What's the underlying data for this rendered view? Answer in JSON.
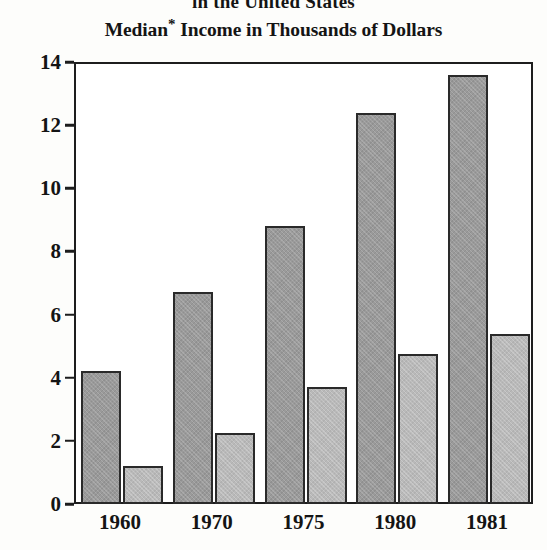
{
  "chart_data": {
    "type": "bar",
    "title": "Median* Income in Thousands of Dollars",
    "suptitle": "in the United States",
    "title_stem": "Median",
    "title_footnote_marker": "*",
    "title_rest": " Income in Thousands of Dollars",
    "xlabel": "",
    "ylabel": "",
    "categories": [
      "1960",
      "1970",
      "1975",
      "1980",
      "1981"
    ],
    "ylim": [
      0,
      14
    ],
    "yticks": [
      0,
      2,
      4,
      6,
      8,
      10,
      12,
      14
    ],
    "ytick_labels": [
      "0",
      "2",
      "4",
      "6",
      "8",
      "10",
      "12",
      "14"
    ],
    "grid": false,
    "legend": "none",
    "series": [
      {
        "name": "series-dark",
        "color": "#9a9a9a",
        "values": [
          4.2,
          6.7,
          8.8,
          12.4,
          13.6
        ]
      },
      {
        "name": "series-light",
        "color": "#b9b9b9",
        "values": [
          1.2,
          2.25,
          3.7,
          4.75,
          5.4
        ]
      }
    ]
  },
  "style": {
    "axis_color": "#1d1d1d",
    "bar_outline": "#2a2a2a",
    "background": "#ffffff",
    "text_color": "#141414"
  }
}
